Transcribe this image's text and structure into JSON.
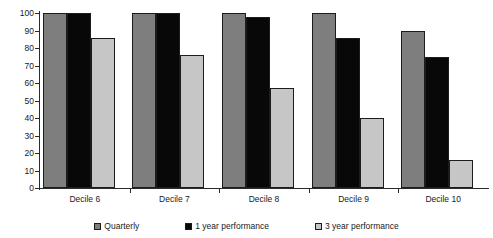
{
  "chart_data": {
    "type": "bar",
    "title": "",
    "subtitle": "",
    "xlabel": "",
    "ylabel": "",
    "categories": [
      "Decile 6",
      "Decile 7",
      "Decile 8",
      "Decile 9",
      "Decile 10"
    ],
    "series": [
      {
        "name": "Quarterly",
        "color": "#7e7e7e",
        "values": [
          100,
          100,
          100,
          100,
          90
        ]
      },
      {
        "name": "1 year performance",
        "color": "#080808",
        "values": [
          100,
          100,
          98,
          86,
          75
        ]
      },
      {
        "name": "3 year performance",
        "color": "#c6c6c6",
        "values": [
          86,
          76,
          57,
          40,
          16
        ]
      }
    ],
    "ylim": [
      0,
      100
    ],
    "ytick_values": [
      0,
      10,
      20,
      30,
      40,
      50,
      60,
      70,
      80,
      90,
      100
    ],
    "ytick_labels": [
      "0",
      "10",
      "20",
      "30",
      "40",
      "50",
      "60",
      "70",
      "80",
      "90",
      "100"
    ],
    "grid": false,
    "legend_position": "bottom"
  },
  "legend": {
    "items": [
      {
        "label": "Quarterly",
        "swatch": "legend-swatch-quarterly"
      },
      {
        "label": "1 year performance",
        "swatch": "legend-swatch-one-year"
      },
      {
        "label": "3 year performance",
        "swatch": "legend-swatch-three-year"
      }
    ]
  },
  "colors": {
    "axis": "#2b2b2b",
    "background": "#ffffff",
    "bar_border": "#1c1c1c",
    "quarterly": "#7e7e7e",
    "one_year": "#080808",
    "three_year": "#c6c6c6"
  }
}
